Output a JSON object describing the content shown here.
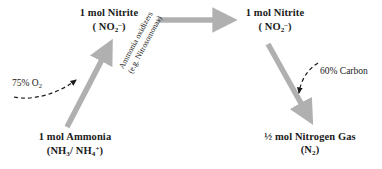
{
  "diagram": {
    "colors": {
      "arrow_gray": "#b0b0b0",
      "text_black": "#1a1a1a",
      "dashed_arrow": "#1a1a1a",
      "background": "#ffffff"
    },
    "nodes": [
      {
        "id": "nitrite-left",
        "line1": "1 mol Nitrite",
        "line2_html": "( NO",
        "line2_plain": "( NO2- )",
        "formula": "NO2-",
        "position": "top-center-left"
      },
      {
        "id": "nitrite-right",
        "line1": "1 mol Nitrite",
        "line2_plain": "( NO2- )",
        "formula": "NO2-",
        "position": "top-right"
      },
      {
        "id": "ammonia",
        "line1": "1 mol Ammonia",
        "line2_plain": "(NH3/ NH4+)",
        "formula": "NH3/NH4+",
        "position": "bottom-left"
      },
      {
        "id": "nitrogen-gas",
        "line1": "½ mol Nitrogen Gas",
        "line2_plain": "(N2)",
        "formula": "N2",
        "position": "bottom-right"
      }
    ],
    "node_text": {
      "nitrite_left_line1": "1 mol Nitrite",
      "nitrite_right_line1": "1 mol Nitrite",
      "ammonia_line1": "1 mol Ammonia",
      "nitrogen_gas_line1": "½ mol Nitrogen Gas"
    },
    "formula_parts": {
      "no2_open": "( NO",
      "no2_sub": "2",
      "no2_sup": "–",
      "no2_close": ")",
      "nh_open": "(NH",
      "nh3_sub": "3",
      "nh_slash": "/ NH",
      "nh4_sub": "4",
      "nh4_sup": "+",
      "nh_close": ")",
      "n2_open": "(N",
      "n2_sub": "2",
      "n2_close": ")"
    },
    "annotations": [
      {
        "id": "o2",
        "text_main": "75% O",
        "text_sub": "2",
        "plain": "75% O2",
        "attached_to": "ammonia-to-nitrite arrow"
      },
      {
        "id": "carbon",
        "text_main": "60% Carbon",
        "plain": "60% Carbon",
        "attached_to": "nitrite-to-nitrogen arrow"
      },
      {
        "id": "ammonia-oxidizers",
        "line1": "Ammonia oxidizers",
        "line2": "(e.g. Nitrosomonas)",
        "plain": "Ammonia oxidizers (e.g. Nitrosomonas)",
        "rotation_deg": -62
      }
    ],
    "arrows": [
      {
        "id": "arrow-ammonia-to-nitrite",
        "from": "ammonia",
        "to": "nitrite-left",
        "style": "solid-gray",
        "direction": "up-right"
      },
      {
        "id": "arrow-nitrite-to-nitrite",
        "from": "nitrite-left",
        "to": "nitrite-right",
        "style": "solid-gray",
        "direction": "right"
      },
      {
        "id": "arrow-nitrite-to-n2",
        "from": "nitrite-right",
        "to": "nitrogen-gas",
        "style": "solid-gray",
        "direction": "down-right"
      },
      {
        "id": "arrow-o2-input",
        "from": "o2",
        "to": "arrow-ammonia-to-nitrite",
        "style": "dashed-black",
        "direction": "curve-right"
      },
      {
        "id": "arrow-carbon-input",
        "from": "carbon",
        "to": "arrow-nitrite-to-n2",
        "style": "dashed-black",
        "direction": "curve-down"
      }
    ]
  }
}
